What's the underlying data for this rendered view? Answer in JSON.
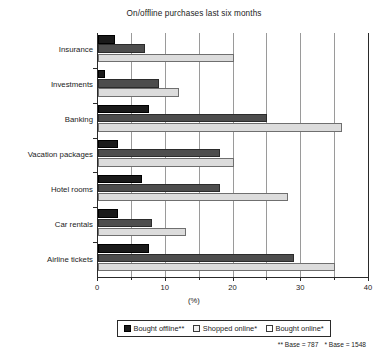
{
  "chart": {
    "title": "On/offline purchases last six months",
    "xlabel": "(%)"
  },
  "legend": {
    "entries": [
      {
        "label": "Bought offline**",
        "swatch": "sw-dark"
      },
      {
        "label": "Shopped online*",
        "swatch": "sw-light"
      },
      {
        "label": "Bought online*",
        "swatch": "sw-mid"
      }
    ],
    "footnote_double": "** Base = 787",
    "footnote_single": "* Base = 1548"
  },
  "axis": {
    "ticks": [
      "0",
      "10",
      "20",
      "30",
      "40"
    ]
  },
  "chart_data": {
    "type": "bar",
    "orientation": "horizontal",
    "title": "On/offline purchases last six months",
    "xlabel": "(%)",
    "ylabel": "",
    "xlim": [
      0,
      40
    ],
    "xticks": [
      0,
      10,
      20,
      30,
      40
    ],
    "minor_gridlines": [
      5,
      15,
      25,
      35
    ],
    "grid": true,
    "legend_position": "bottom",
    "categories": [
      "Insurance",
      "Investments",
      "Banking",
      "Vacation packages",
      "Hotel rooms",
      "Car rentals",
      "Airline tickets"
    ],
    "series": [
      {
        "name": "Bought online*",
        "color": "#1a1a1a",
        "bar_position": "top",
        "values": [
          2.5,
          1.0,
          7.5,
          3.0,
          6.5,
          3.0,
          7.5
        ]
      },
      {
        "name": "Bought offline**",
        "color": "#4d4d4d",
        "bar_position": "middle",
        "values": [
          7.0,
          9.0,
          25.0,
          18.0,
          18.0,
          8.0,
          29.0
        ]
      },
      {
        "name": "Shopped online*",
        "color": "#dcdcdc",
        "bar_position": "bottom",
        "values": [
          20.0,
          12.0,
          36.0,
          20.0,
          28.0,
          13.0,
          35.0
        ]
      }
    ],
    "notes": [
      "** Base = 787",
      "* Base = 1548"
    ]
  }
}
